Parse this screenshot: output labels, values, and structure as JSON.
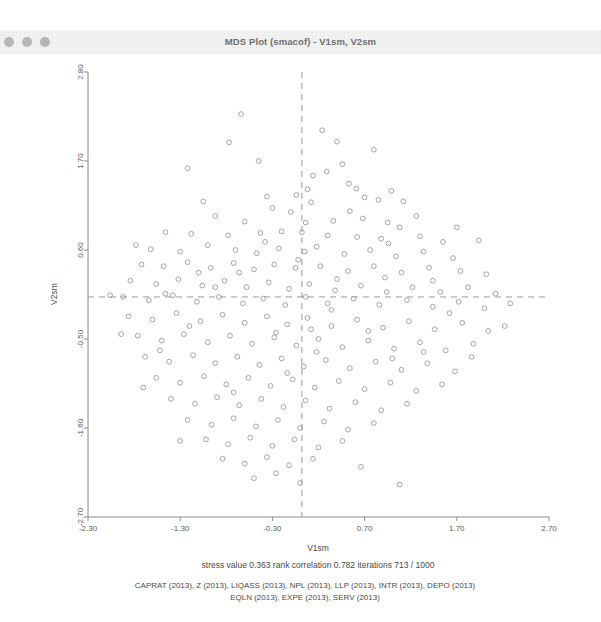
{
  "window": {
    "title": "MDS Plot (smacof) - V1sm, V2sm",
    "controls": [
      "close-dot",
      "minimize-dot",
      "zoom-dot"
    ]
  },
  "chart_data": {
    "type": "scatter",
    "title": "MDS Plot (smacof) - V1sm, V2sm",
    "xlabel": "V1sm",
    "ylabel": "V2sm",
    "xlim": [
      -2.3,
      2.7
    ],
    "ylim": [
      -2.7,
      2.8
    ],
    "xticks": [
      "-2.30",
      "-1.30",
      "-0.30",
      "0.70",
      "1.70",
      "2.70"
    ],
    "xtickvals": [
      -2.3,
      -1.3,
      -0.3,
      0.7,
      1.7,
      2.7
    ],
    "yticks": [
      "2.80",
      "1.70",
      "0.60",
      "-0.50",
      "-1.60",
      "-2.70"
    ],
    "ytickvals": [
      2.8,
      1.7,
      0.6,
      -0.5,
      -1.6,
      -2.7
    ],
    "grid": false,
    "legend": "none",
    "marker": "open-circle",
    "marker_color": "#9b9b9b",
    "reference_lines": {
      "vertical_x": 0.02,
      "horizontal_y": 0.02,
      "style": "dashed",
      "color": "#9a9a9a"
    },
    "points": [
      [
        -0.64,
        2.28
      ],
      [
        0.24,
        2.08
      ],
      [
        -0.77,
        1.93
      ],
      [
        0.4,
        1.94
      ],
      [
        0.8,
        1.84
      ],
      [
        -1.22,
        1.61
      ],
      [
        0.14,
        1.52
      ],
      [
        0.29,
        1.57
      ],
      [
        0.08,
        1.35
      ],
      [
        0.53,
        1.42
      ],
      [
        0.61,
        1.36
      ],
      [
        0.99,
        1.33
      ],
      [
        -0.04,
        1.28
      ],
      [
        0.7,
        1.25
      ],
      [
        0.85,
        1.22
      ],
      [
        1.12,
        1.2
      ],
      [
        -0.36,
        1.26
      ],
      [
        -0.3,
        1.12
      ],
      [
        -0.1,
        1.07
      ],
      [
        0.12,
        1.19
      ],
      [
        -0.92,
        1.02
      ],
      [
        -0.6,
        0.95
      ],
      [
        0.36,
        0.96
      ],
      [
        0.68,
        0.99
      ],
      [
        0.95,
        0.94
      ],
      [
        1.08,
        0.88
      ],
      [
        -1.46,
        0.82
      ],
      [
        -1.18,
        0.8
      ],
      [
        -0.78,
        0.78
      ],
      [
        -0.43,
        0.81
      ],
      [
        -0.2,
        0.83
      ],
      [
        0.02,
        0.82
      ],
      [
        0.3,
        0.78
      ],
      [
        0.62,
        0.76
      ],
      [
        0.88,
        0.74
      ],
      [
        1.3,
        0.77
      ],
      [
        1.55,
        0.7
      ],
      [
        -1.62,
        0.61
      ],
      [
        -1.3,
        0.58
      ],
      [
        -1.0,
        0.66
      ],
      [
        -0.7,
        0.6
      ],
      [
        -0.47,
        0.56
      ],
      [
        -0.23,
        0.62
      ],
      [
        0.05,
        0.58
      ],
      [
        0.18,
        0.64
      ],
      [
        0.48,
        0.55
      ],
      [
        0.76,
        0.6
      ],
      [
        1.04,
        0.52
      ],
      [
        1.34,
        0.58
      ],
      [
        1.66,
        0.5
      ],
      [
        -1.72,
        0.42
      ],
      [
        -1.48,
        0.4
      ],
      [
        -1.22,
        0.45
      ],
      [
        -0.97,
        0.38
      ],
      [
        -0.72,
        0.44
      ],
      [
        -0.5,
        0.36
      ],
      [
        -0.28,
        0.42
      ],
      [
        -0.05,
        0.38
      ],
      [
        0.22,
        0.4
      ],
      [
        0.52,
        0.34
      ],
      [
        0.8,
        0.4
      ],
      [
        1.1,
        0.32
      ],
      [
        1.4,
        0.38
      ],
      [
        1.74,
        0.34
      ],
      [
        2.02,
        0.3
      ],
      [
        -1.84,
        0.22
      ],
      [
        -1.56,
        0.18
      ],
      [
        -1.32,
        0.24
      ],
      [
        -1.06,
        0.16
      ],
      [
        -0.82,
        0.22
      ],
      [
        -0.58,
        0.14
      ],
      [
        -0.34,
        0.2
      ],
      [
        -0.12,
        0.12
      ],
      [
        0.1,
        0.18
      ],
      [
        0.38,
        0.1
      ],
      [
        0.66,
        0.16
      ],
      [
        0.94,
        0.08
      ],
      [
        1.22,
        0.14
      ],
      [
        1.52,
        0.08
      ],
      [
        1.82,
        0.14
      ],
      [
        2.12,
        0.06
      ],
      [
        -1.92,
        0.02
      ],
      [
        -1.64,
        -0.02
      ],
      [
        -1.38,
        0.04
      ],
      [
        -1.12,
        -0.04
      ],
      [
        -0.88,
        0.02
      ],
      [
        -0.62,
        -0.06
      ],
      [
        -0.4,
        0.0
      ],
      [
        -0.16,
        -0.08
      ],
      [
        0.06,
        0.02
      ],
      [
        0.3,
        -0.06
      ],
      [
        0.58,
        0.0
      ],
      [
        0.86,
        -0.08
      ],
      [
        1.16,
        -0.02
      ],
      [
        1.44,
        -0.1
      ],
      [
        1.72,
        -0.04
      ],
      [
        2.0,
        -0.12
      ],
      [
        2.28,
        -0.06
      ],
      [
        -1.86,
        -0.22
      ],
      [
        -1.6,
        -0.26
      ],
      [
        -1.34,
        -0.18
      ],
      [
        -1.08,
        -0.28
      ],
      [
        -0.84,
        -0.2
      ],
      [
        -0.6,
        -0.3
      ],
      [
        -0.36,
        -0.22
      ],
      [
        -0.14,
        -0.32
      ],
      [
        0.08,
        -0.24
      ],
      [
        0.34,
        -0.34
      ],
      [
        0.62,
        -0.26
      ],
      [
        0.9,
        -0.36
      ],
      [
        1.18,
        -0.28
      ],
      [
        1.46,
        -0.38
      ],
      [
        1.76,
        -0.3
      ],
      [
        2.04,
        -0.4
      ],
      [
        -1.76,
        -0.46
      ],
      [
        -1.5,
        -0.52
      ],
      [
        -1.26,
        -0.44
      ],
      [
        -1.0,
        -0.54
      ],
      [
        -0.76,
        -0.46
      ],
      [
        -0.52,
        -0.56
      ],
      [
        -0.28,
        -0.48
      ],
      [
        -0.04,
        -0.58
      ],
      [
        0.2,
        -0.5
      ],
      [
        0.46,
        -0.6
      ],
      [
        0.74,
        -0.52
      ],
      [
        1.02,
        -0.62
      ],
      [
        1.3,
        -0.54
      ],
      [
        1.58,
        -0.64
      ],
      [
        1.88,
        -0.56
      ],
      [
        -1.68,
        -0.72
      ],
      [
        -1.42,
        -0.78
      ],
      [
        -1.16,
        -0.7
      ],
      [
        -0.92,
        -0.8
      ],
      [
        -0.68,
        -0.72
      ],
      [
        -0.44,
        -0.82
      ],
      [
        -0.2,
        -0.74
      ],
      [
        0.04,
        -0.84
      ],
      [
        0.28,
        -0.76
      ],
      [
        0.54,
        -0.86
      ],
      [
        0.82,
        -0.78
      ],
      [
        1.1,
        -0.88
      ],
      [
        1.38,
        -0.8
      ],
      [
        1.68,
        -0.9
      ],
      [
        -1.56,
        -0.98
      ],
      [
        -1.3,
        -1.04
      ],
      [
        -1.04,
        -0.96
      ],
      [
        -0.8,
        -1.06
      ],
      [
        -0.56,
        -0.98
      ],
      [
        -0.32,
        -1.08
      ],
      [
        -0.08,
        -1.0
      ],
      [
        0.16,
        -1.1
      ],
      [
        0.42,
        -1.02
      ],
      [
        0.7,
        -1.12
      ],
      [
        0.98,
        -1.04
      ],
      [
        1.26,
        -1.14
      ],
      [
        1.54,
        -1.06
      ],
      [
        -1.4,
        -1.24
      ],
      [
        -1.14,
        -1.3
      ],
      [
        -0.9,
        -1.22
      ],
      [
        -0.66,
        -1.32
      ],
      [
        -0.42,
        -1.24
      ],
      [
        -0.18,
        -1.34
      ],
      [
        0.06,
        -1.26
      ],
      [
        0.32,
        -1.36
      ],
      [
        0.6,
        -1.28
      ],
      [
        0.88,
        -1.38
      ],
      [
        1.16,
        -1.3
      ],
      [
        -1.22,
        -1.5
      ],
      [
        -0.96,
        -1.56
      ],
      [
        -0.72,
        -1.48
      ],
      [
        -0.48,
        -1.58
      ],
      [
        -0.24,
        -1.5
      ],
      [
        0.0,
        -1.6
      ],
      [
        0.26,
        -1.52
      ],
      [
        0.52,
        -1.62
      ],
      [
        0.8,
        -1.54
      ],
      [
        -1.02,
        -1.74
      ],
      [
        -0.78,
        -1.8
      ],
      [
        -0.54,
        -1.72
      ],
      [
        -0.3,
        -1.82
      ],
      [
        -0.06,
        -1.74
      ],
      [
        0.2,
        -1.84
      ],
      [
        0.46,
        -1.76
      ],
      [
        -0.84,
        -1.98
      ],
      [
        -0.6,
        -2.04
      ],
      [
        -0.36,
        -1.96
      ],
      [
        -0.12,
        -2.06
      ],
      [
        0.14,
        -1.98
      ],
      [
        -0.5,
        -2.22
      ],
      [
        -0.26,
        -2.16
      ],
      [
        0.0,
        -2.28
      ],
      [
        1.08,
        -2.3
      ],
      [
        -1.78,
        0.66
      ],
      [
        -1.7,
        -1.1
      ],
      [
        1.94,
        0.72
      ],
      [
        -0.45,
        1.7
      ],
      [
        0.46,
        1.66
      ],
      [
        1.26,
        1.02
      ],
      [
        -1.05,
        1.2
      ],
      [
        0.06,
        0.94
      ],
      [
        1.86,
        -0.72
      ],
      [
        -1.3,
        -1.76
      ],
      [
        0.66,
        -2.08
      ],
      [
        2.22,
        -0.34
      ],
      [
        -2.06,
        0.04
      ],
      [
        -0.92,
        0.14
      ],
      [
        0.92,
        0.26
      ],
      [
        1.62,
        -0.18
      ],
      [
        -1.46,
        0.06
      ],
      [
        0.34,
        -0.14
      ],
      [
        -0.02,
        0.48
      ],
      [
        1.44,
        0.22
      ],
      [
        -0.66,
        0.32
      ],
      [
        0.74,
        -0.4
      ],
      [
        -1.2,
        -0.34
      ],
      [
        0.18,
        -0.66
      ],
      [
        1.0,
        -0.74
      ],
      [
        -0.14,
        -0.92
      ],
      [
        -1.52,
        -0.64
      ],
      [
        0.54,
        1.08
      ],
      [
        -0.38,
        0.7
      ],
      [
        1.7,
        0.88
      ],
      [
        -1.94,
        -0.44
      ],
      [
        0.4,
        0.24
      ],
      [
        -0.72,
        -1.16
      ],
      [
        1.34,
        -0.66
      ],
      [
        -0.26,
        -0.42
      ],
      [
        0.96,
        0.68
      ],
      [
        -1.1,
        0.32
      ],
      [
        0.12,
        -0.38
      ]
    ]
  },
  "footer": {
    "stats_line": "stress value  0.363   rank correlation  0.782   iterations  713  /  1000",
    "variables_line_1": "CAPRAT (2013), Z (2013), LIQASS (2013), NPL (2013), LLP (2013), INTR (2013), DEPO (2013)",
    "variables_line_2": "EQLN (2013), EXPE (2013), SERV (2013)"
  }
}
